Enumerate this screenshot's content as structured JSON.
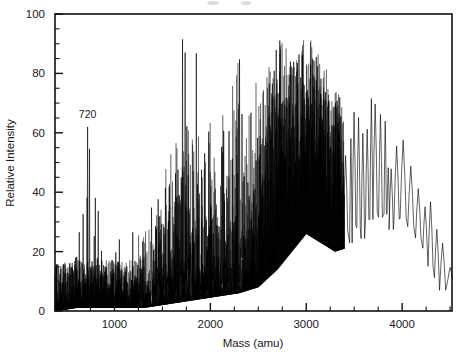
{
  "figure": {
    "type": "mass-spectrum",
    "annotation_label": "720"
  },
  "axes": {
    "x": {
      "title": "Mass (amu)",
      "ticklabels": [
        "1000",
        "2000",
        "3000",
        "4000"
      ],
      "tickvalues": [
        1000,
        2000,
        3000,
        4000
      ],
      "min": 380,
      "max": 4520,
      "minor_step": 250
    },
    "y": {
      "title": "Relative Intensity",
      "ticklabels": [
        "0",
        "20",
        "40",
        "60",
        "80",
        "100"
      ],
      "tickvalues": [
        0,
        20,
        40,
        60,
        80,
        100
      ],
      "min": 0,
      "max": 100,
      "minor_step": 5
    }
  },
  "colors": {
    "trace": "#000000",
    "axis": "#111111",
    "text": "#1a1a1a",
    "background": "#ffffff"
  },
  "chart_data": {
    "type": "line",
    "title": "",
    "subtitle": "",
    "xlabel": "Mass (amu)",
    "ylabel": "Relative Intensity",
    "xlim": [
      380,
      4520
    ],
    "ylim": [
      0,
      100
    ],
    "grid": false,
    "legend": "none",
    "annotations": [
      {
        "text": "720",
        "x": 720,
        "y": 62,
        "note": "C60 fullerene parent ion peak"
      }
    ],
    "envelope": {
      "x": [
        400,
        600,
        720,
        900,
        1100,
        1300,
        1500,
        1700,
        1900,
        2100,
        2300,
        2500,
        2700,
        2900,
        3000,
        3100,
        3300,
        3500,
        3700,
        3750,
        3900,
        4000,
        4050,
        4200,
        4300,
        4450,
        4500
      ],
      "upper": [
        18,
        19,
        62,
        22,
        27,
        30,
        53,
        74,
        70,
        71,
        83,
        74,
        96,
        90,
        97,
        93,
        78,
        67,
        73,
        73,
        58,
        59,
        59,
        39,
        39,
        24,
        18
      ],
      "lower": [
        0,
        1,
        1,
        1,
        1,
        1,
        2,
        3,
        4,
        5,
        6,
        8,
        14,
        22,
        26,
        24,
        20,
        22,
        25,
        30,
        25,
        25,
        26,
        24,
        12,
        3,
        10
      ]
    },
    "named_peaks": [
      {
        "x": 720,
        "y": 62
      },
      {
        "x": 1420,
        "y": 53
      },
      {
        "x": 1700,
        "y": 74
      },
      {
        "x": 2180,
        "y": 83
      },
      {
        "x": 2600,
        "y": 95
      },
      {
        "x": 2960,
        "y": 97
      },
      {
        "x": 3030,
        "y": 93
      },
      {
        "x": 3250,
        "y": 78
      },
      {
        "x": 3720,
        "y": 73
      },
      {
        "x": 3940,
        "y": 58
      },
      {
        "x": 4030,
        "y": 59
      },
      {
        "x": 4200,
        "y": 39
      },
      {
        "x": 4330,
        "y": 39
      }
    ]
  }
}
